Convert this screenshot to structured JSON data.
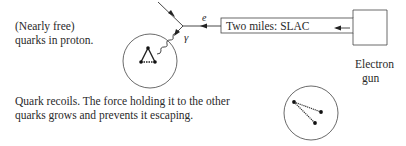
{
  "labels": {
    "quarks_line1": "(Nearly free)",
    "quarks_line2": "quarks in proton.",
    "recoil_line1": "Quark recoils. The force holding it to the other",
    "recoil_line2": "quarks grows and prevents it escaping.",
    "accelerator": "Two miles: SLAC",
    "gun_line1": "Electron",
    "gun_line2": "gun",
    "electron_symbol": "e",
    "photon_symbol": "γ"
  },
  "colors": {
    "line": "#333333",
    "text": "#2a2a2a",
    "background": "#ffffff"
  },
  "geometry": {
    "proton_circle": {
      "cx": 150,
      "cy": 61,
      "r": 27
    },
    "recoil_circle": {
      "cx": 311,
      "cy": 113,
      "r": 27
    },
    "slac_box": {
      "x": 221,
      "y": 18,
      "w": 132,
      "h": 15
    },
    "gun_box": {
      "x": 353,
      "y": 10,
      "w": 34,
      "h": 35
    }
  }
}
